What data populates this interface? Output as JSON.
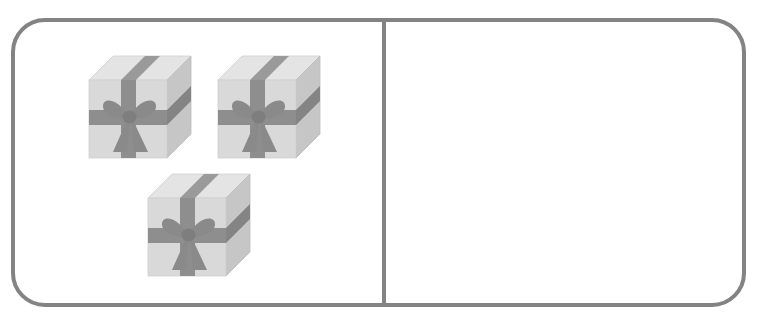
{
  "scene": {
    "type": "counting-worksheet-graphic",
    "width": 761,
    "height": 327,
    "background_color": "#ffffff",
    "description": "Rounded rectangle frame divided by a vertical line into a left and a right panel; three identical grey gift boxes are drawn in the left panel, the right panel is empty."
  },
  "frame": {
    "name": "rounded-rectangle-frame",
    "border_color": "#838383",
    "border_width": 4,
    "corner_radius": 34,
    "fill": "none"
  },
  "divider": {
    "name": "vertical-divider",
    "color": "#838383",
    "thickness": 4,
    "x": 382
  },
  "panels": {
    "left": {
      "label": "",
      "item_count": 3,
      "item_name": "gift-box"
    },
    "right": {
      "label": "",
      "item_count": 0,
      "item_name": "gift-box"
    }
  },
  "gift_box": {
    "front_face_color": "#d9d9d9",
    "top_face_color": "#e4e4e4",
    "side_face_color": "#c6c6c6",
    "ribbon_color": "#8e8e8e",
    "ribbon_top_color": "#9a9a9a",
    "ribbon_side_color": "#848484",
    "outline_color": "#b5b5b5"
  },
  "items": [
    {
      "id": "gift-box-1",
      "x": 85,
      "y": 52,
      "size": 110
    },
    {
      "id": "gift-box-2",
      "x": 214,
      "y": 52,
      "size": 110
    },
    {
      "id": "gift-box-3",
      "x": 144,
      "y": 170,
      "size": 110
    }
  ]
}
